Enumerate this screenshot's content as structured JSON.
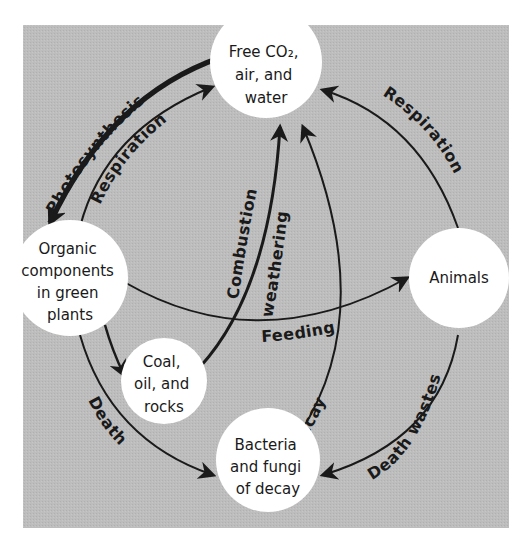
{
  "diagram": {
    "type": "cycle",
    "colors": {
      "panel": "#bdbdbd",
      "node_fill": "#ffffff",
      "ink": "#1a1a1a",
      "page": "#ffffff"
    },
    "nodes": {
      "co2": {
        "lines": [
          "Free CO₂,",
          "air, and",
          "water"
        ]
      },
      "organic": {
        "lines": [
          "Organic",
          "components",
          "in green",
          "plants"
        ]
      },
      "animals": {
        "lines": [
          "Animals"
        ]
      },
      "coal": {
        "lines": [
          "Coal,",
          "oil, and",
          "rocks"
        ]
      },
      "bacteria": {
        "lines": [
          "Bacteria",
          "and fungi",
          "of decay"
        ]
      }
    },
    "edges": {
      "photosynthesis": {
        "label": "Photosynthesis",
        "from": "Free CO2, air, and water",
        "to": "Organic components in green plants"
      },
      "respiration_plants": {
        "label": "Respiration",
        "from": "Organic components in green plants",
        "to": "Free CO2, air, and water"
      },
      "respiration_animals": {
        "label": "Respiration",
        "from": "Animals",
        "to": "Free CO2, air, and water"
      },
      "combustion": {
        "label": "Combustion",
        "from": "Coal, oil, and rocks",
        "to": "Free CO2, air, and water"
      },
      "weathering": {
        "label": "weathering",
        "from": "Coal, oil, and rocks",
        "to": "Free CO2, air, and water"
      },
      "feeding": {
        "label": "Feeding",
        "from": "Organic components in green plants",
        "to": "Animals"
      },
      "fossilization": {
        "label": "",
        "from": "Organic components in green plants",
        "to": "Coal, oil, and rocks"
      },
      "decay": {
        "label": "Decay",
        "from": "Bacteria and fungi of decay",
        "to": "Free CO2, air, and water"
      },
      "death": {
        "label": "Death",
        "from": "Organic components in green plants",
        "to": "Bacteria and fungi of decay"
      },
      "death_wastes": {
        "label": "Death wastes",
        "from": "Animals",
        "to": "Bacteria and fungi of decay"
      }
    }
  }
}
